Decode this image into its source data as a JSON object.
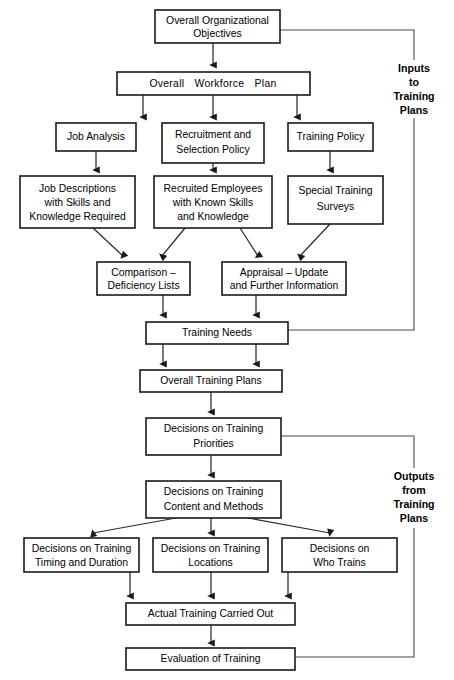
{
  "diagram": {
    "background": "#ffffff",
    "line_color": "#2b2b2b",
    "box_fill": "#ffffff",
    "box_stroke": "#1a1a1a",
    "nodes": {
      "overall_objectives": "Overall Organizational\nObjectives",
      "overall_objectives_l1": "Overall Organizational",
      "overall_objectives_l2": "Objectives",
      "workforce_plan": "Overall   Workforce   Plan",
      "job_analysis": "Job Analysis",
      "recruitment_policy_l1": "Recruitment and",
      "recruitment_policy_l2": "Selection Policy",
      "training_policy": "Training Policy",
      "job_descriptions_l1": "Job Descriptions",
      "job_descriptions_l2": "with Skills and",
      "job_descriptions_l3": "Knowledge Required",
      "recruited_employees_l1": "Recruited Employees",
      "recruited_employees_l2": "with Known Skills",
      "recruited_employees_l3": "and Knowledge",
      "special_surveys_l1": "Special Training",
      "special_surveys_l2": "Surveys",
      "comparison_l1": "Comparison –",
      "comparison_l2": "Deficiency Lists",
      "appraisal_l1": "Appraisal – Update",
      "appraisal_l2": "and Further Information",
      "training_needs": "Training Needs",
      "overall_training_plans": "Overall Training Plans",
      "training_priorities_l1": "Decisions on Training",
      "training_priorities_l2": "Priorities",
      "content_methods_l1": "Decisions on Training",
      "content_methods_l2": "Content and Methods",
      "timing_duration_l1": "Decisions on Training",
      "timing_duration_l2": "Timing and Duration",
      "locations_l1": "Decisions on Training",
      "locations_l2": "Locations",
      "who_trains_l1": "Decisions on",
      "who_trains_l2": "Who Trains",
      "actual_training": "Actual Training Carried Out",
      "evaluation": "Evaluation of Training"
    },
    "annotations": {
      "inputs_l1": "Inputs",
      "inputs_l2": "to",
      "inputs_l3": "Training",
      "inputs_l4": "Plans",
      "outputs_l1": "Outputs",
      "outputs_l2": "from",
      "outputs_l3": "Training",
      "outputs_l4": "Plans"
    }
  }
}
